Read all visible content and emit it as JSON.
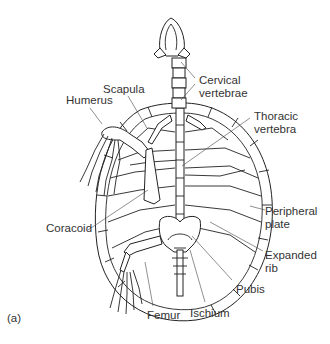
{
  "figure": {
    "panel_label": "(a)",
    "labels": {
      "cervical": "Cervical\nvertebrae",
      "thoracic": "Thoracic\nvertebra",
      "scapula": "Scapula",
      "humerus": "Humerus",
      "coracoid": "Coracoid",
      "peripheral": "Peripheral\nplate",
      "expanded_rib": "Expanded\nrib",
      "pubis": "Pubis",
      "ischium": "Ischium",
      "femur": "Femur"
    }
  }
}
